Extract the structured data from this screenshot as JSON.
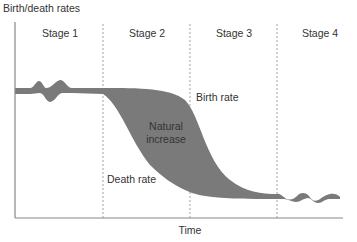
{
  "diagram": {
    "y_axis_label": "Birth/death rates",
    "x_axis_label": "Time",
    "stages": [
      {
        "label": "Stage 1"
      },
      {
        "label": "Stage 2"
      },
      {
        "label": "Stage 3"
      },
      {
        "label": "Stage 4"
      }
    ],
    "annotations": {
      "birth_rate": "Birth rate",
      "death_rate": "Death rate",
      "natural_increase_line1": "Natural",
      "natural_increase_line2": "increase"
    },
    "colors": {
      "fill": "#7a7a7a",
      "axis": "#888888",
      "divider": "#999999",
      "text": "#333333"
    }
  }
}
